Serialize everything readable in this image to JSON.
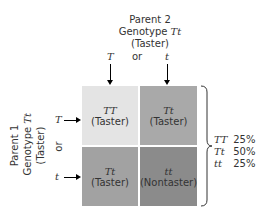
{
  "parent2": {
    "line1": "Parent 2",
    "line2_prefix": "Genotype ",
    "line2_genotype": "Tt",
    "line3": "(Taster)",
    "allele_left": "T",
    "or": "or",
    "allele_right": "t"
  },
  "parent1": {
    "line1": "Parent 1",
    "line2_prefix": "Genotype ",
    "line2_genotype": "Tt",
    "line3": "(Taster)",
    "allele_top": "T",
    "or": "or",
    "allele_bottom": "t"
  },
  "grid": {
    "cells": [
      {
        "genotype": "TT",
        "phenotype": "(Taster)",
        "color": "#e4e4e4"
      },
      {
        "genotype": "Tt",
        "phenotype": "(Taster)",
        "color": "#a9a9a9"
      },
      {
        "genotype": "Tt",
        "phenotype": "(Taster)",
        "color": "#a2a2a2"
      },
      {
        "genotype": "tt",
        "phenotype": "(Nontaster)",
        "color": "#8b8b8b"
      }
    ]
  },
  "summary": [
    {
      "genotype": "TT",
      "percent": "25%"
    },
    {
      "genotype": "Tt",
      "percent": "50%"
    },
    {
      "genotype": "tt",
      "percent": "25%"
    }
  ]
}
